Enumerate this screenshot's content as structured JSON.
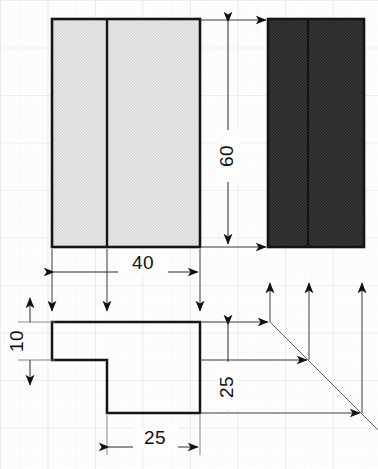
{
  "drawing": {
    "title": "Orthographic projection exercise",
    "background_color": "#fdfdfd",
    "grid_color": "#e9e9ee",
    "line_color": "#1a1a1a",
    "thin_line_color": "#4a4a4a",
    "light_fill_color": "#e3e3e3",
    "dark_fill_color": "#3a3a3a",
    "views": [
      {
        "name": "front-view",
        "style": "light-hatched-rectangle",
        "x": 52,
        "y": 19,
        "width": 148,
        "height": 228,
        "divider_x": 107
      },
      {
        "name": "side-view",
        "style": "dark-hatched-rectangle",
        "x": 268,
        "y": 19,
        "width": 96,
        "height": 228,
        "divider_x": 308
      },
      {
        "name": "top-view",
        "style": "L-shaped-outline",
        "points": "52,322 200,322 200,413 107,413 107,360 52,360"
      }
    ],
    "dimensions": [
      {
        "name": "dimension-height-60",
        "label": "60",
        "orientation": "vertical",
        "value": 60,
        "line_x": 228,
        "y_start": 19,
        "y_end": 247,
        "text_x": 228,
        "text_y": 155
      },
      {
        "name": "dimension-width-40",
        "label": "40",
        "orientation": "horizontal",
        "value": 40,
        "line_y": 270,
        "x_start": 52,
        "x_end": 200,
        "text_x": 143,
        "text_y": 265
      },
      {
        "name": "dimension-depth-10",
        "label": "10",
        "orientation": "vertical",
        "value": 10,
        "line_x": 30,
        "y_start": 322,
        "y_end": 360,
        "text_x": 22,
        "text_y": 348
      },
      {
        "name": "dimension-depth-25",
        "label": "25",
        "orientation": "vertical",
        "value": 25,
        "line_x": 228,
        "y_start": 322,
        "y_end": 413,
        "text_x": 228,
        "text_y": 388
      },
      {
        "name": "dimension-width-25",
        "label": "25",
        "orientation": "horizontal",
        "value": 25,
        "line_y": 447,
        "x_start": 107,
        "x_end": 200,
        "text_x": 155,
        "text_y": 441
      }
    ],
    "projection": {
      "miter_line": {
        "x1": 270,
        "y1": 322,
        "x2": 378,
        "y2": 430
      },
      "vertical_projectors": [
        {
          "name": "projector-up-left",
          "x": 270,
          "y_top": 283,
          "y_bottom": 322
        },
        {
          "name": "projector-up-mid",
          "x": 309,
          "y_top": 283,
          "y_bottom": 360
        },
        {
          "name": "projector-up-right",
          "x": 362,
          "y_top": 283,
          "y_bottom": 413
        }
      ],
      "horizontal_projectors": [
        {
          "name": "projector-right-top",
          "y": 322,
          "x_start": 200,
          "x_end": 270
        },
        {
          "name": "projector-right-middle",
          "y": 360,
          "x_start": 200,
          "x_end": 309
        },
        {
          "name": "projector-right-bottom",
          "y": 413,
          "x_start": 200,
          "x_end": 362
        }
      ],
      "top_transfer_lines": [
        {
          "name": "transfer-line-top",
          "y": 20,
          "x_start": 200,
          "x_end": 268
        },
        {
          "name": "transfer-line-bottom",
          "y": 247,
          "x_start": 200,
          "x_end": 268
        }
      ]
    }
  }
}
